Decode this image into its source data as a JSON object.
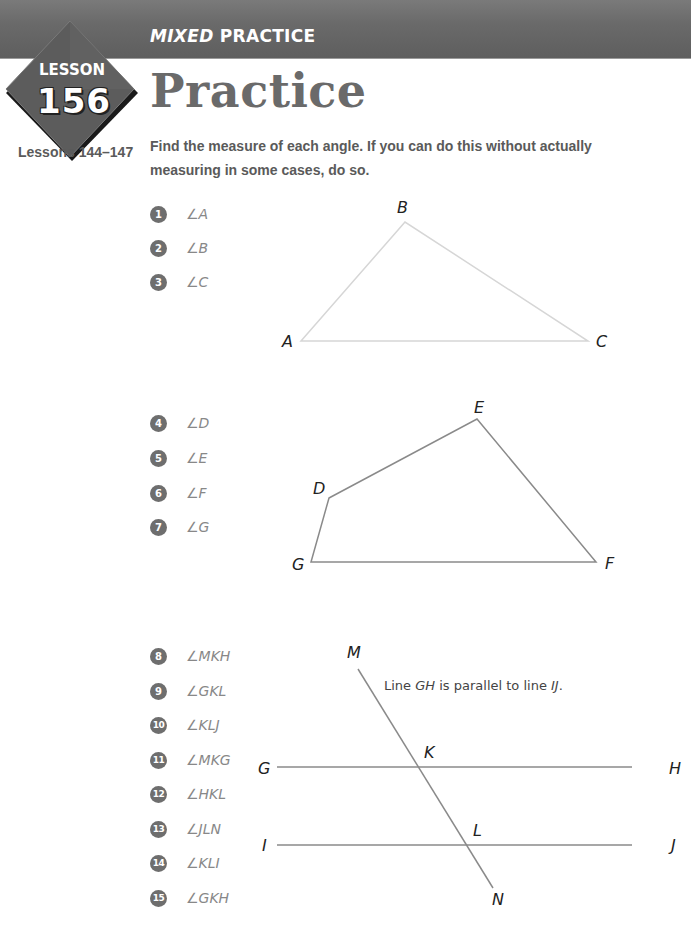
{
  "header": {
    "section_label_italic": "MIXED",
    "section_label_rest": " PRACTICE",
    "badge": {
      "word": "LESSON",
      "number": "156"
    },
    "title": "Practice"
  },
  "sidebar": {
    "lessons_ref": "Lessons 144–147"
  },
  "instructions": "Find the measure of each angle. If you can do this without actually measuring in some cases, do so.",
  "colors": {
    "header_band": "#6a6a6a",
    "badge_fill": "#5a5a5a",
    "title": "#6a6a6a",
    "number_circle": "#6e6e6e",
    "triangle_stroke": "#d8d8d8",
    "figure_stroke": "#8a8a8a"
  },
  "groups": [
    {
      "figure": "triangle",
      "problems": [
        {
          "number": "1",
          "angle": "∠A"
        },
        {
          "number": "2",
          "angle": "∠B"
        },
        {
          "number": "3",
          "angle": "∠C"
        }
      ],
      "vertices": {
        "A": "A",
        "B": "B",
        "C": "C"
      }
    },
    {
      "figure": "quadrilateral",
      "problems": [
        {
          "number": "4",
          "angle": "∠D"
        },
        {
          "number": "5",
          "angle": "∠E"
        },
        {
          "number": "6",
          "angle": "∠F"
        },
        {
          "number": "7",
          "angle": "∠G"
        }
      ],
      "vertices": {
        "D": "D",
        "E": "E",
        "F": "F",
        "G": "G"
      }
    },
    {
      "figure": "parallel-lines-transversal",
      "note_prefix": "Line ",
      "note_line1": "GH",
      "note_middle": " is parallel to line ",
      "note_line2": "IJ",
      "note_suffix": ".",
      "problems": [
        {
          "number": "8",
          "angle": "∠MKH"
        },
        {
          "number": "9",
          "angle": "∠GKL"
        },
        {
          "number": "10",
          "angle": "∠KLJ"
        },
        {
          "number": "11",
          "angle": "∠MKG"
        },
        {
          "number": "12",
          "angle": "∠HKL"
        },
        {
          "number": "13",
          "angle": "∠JLN"
        },
        {
          "number": "14",
          "angle": "∠KLI"
        },
        {
          "number": "15",
          "angle": "∠GKH"
        }
      ],
      "points": {
        "M": "M",
        "N": "N",
        "K": "K",
        "L": "L",
        "G": "G",
        "H": "H",
        "I": "I",
        "J": "J"
      }
    }
  ]
}
